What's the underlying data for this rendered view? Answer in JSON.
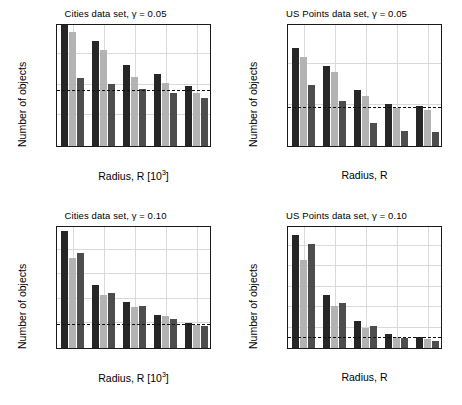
{
  "figure": {
    "kind": "matlab-figure",
    "panel_count": 4,
    "axis_label_y": "Number of objects",
    "series_colors": [
      "#262626",
      "#b3b3b3",
      "#4d4d4d"
    ],
    "threshold_color": "#111111",
    "grid_color": "#d9d9d9"
  },
  "chart_data": [
    {
      "type": "bar",
      "title": "Cities data set, γ = 0.05",
      "xlabel": "Radius, R [10³]",
      "ylabel": "Number of objects",
      "categories": [
        "20.0",
        "22.5",
        "25.0",
        "27.5",
        "30.0"
      ],
      "series": [
        {
          "name": "series-1",
          "color": "#262626",
          "values": [
            40.0,
            34.3,
            26.5,
            23.5,
            19.5
          ]
        },
        {
          "name": "series-2",
          "color": "#b3b3b3",
          "values": [
            37.0,
            31.3,
            22.3,
            20.5,
            17.4
          ]
        },
        {
          "name": "series-3",
          "color": "#4d4d4d",
          "values": [
            22.1,
            20.3,
            18.6,
            17.4,
            15.6
          ]
        }
      ],
      "threshold": 18.0,
      "threshold_style": "dashed",
      "ylim": [
        0,
        40
      ],
      "yticks": [
        0,
        10,
        20,
        30,
        40
      ],
      "grid": true,
      "legend": "none"
    },
    {
      "type": "bar",
      "title": "US Points data set, γ = 0.05",
      "xlabel": "Radius, R",
      "ylabel": "Number of objects",
      "categories": [
        "0.75",
        "1.00",
        "1.25",
        "1.50",
        "1.75"
      ],
      "series": [
        {
          "name": "series-1",
          "color": "#262626",
          "values": [
            120,
            98,
            68,
            51,
            49
          ]
        },
        {
          "name": "series-2",
          "color": "#b3b3b3",
          "values": [
            108,
            90,
            61,
            46,
            44
          ]
        },
        {
          "name": "series-3",
          "color": "#4d4d4d",
          "values": [
            75,
            55,
            28,
            18,
            17
          ]
        }
      ],
      "threshold": 46,
      "threshold_style": "dashed",
      "ylim": [
        0,
        150
      ],
      "yticks": [
        0,
        50,
        100,
        150
      ],
      "grid": true,
      "legend": "none"
    },
    {
      "type": "bar",
      "title": "Cities data set, γ = 0.10",
      "xlabel": "Radius, R [10³]",
      "ylabel": "Number of objects",
      "categories": [
        "20.0",
        "22.5",
        "25.0",
        "27.5",
        "30.0"
      ],
      "series": [
        {
          "name": "series-1",
          "color": "#262626",
          "values": [
            95,
            51.5,
            37.5,
            27,
            20.5
          ]
        },
        {
          "name": "series-2",
          "color": "#b3b3b3",
          "values": [
            73.5,
            43.5,
            33,
            26,
            19
          ]
        },
        {
          "name": "series-3",
          "color": "#4d4d4d",
          "values": [
            77.5,
            44.5,
            34,
            23.5,
            17.5
          ]
        }
      ],
      "threshold": 18.5,
      "threshold_style": "dashed",
      "ylim": [
        0,
        100
      ],
      "yticks": [
        0,
        20,
        40,
        60,
        80,
        100
      ],
      "grid": true,
      "legend": "none"
    },
    {
      "type": "bar",
      "title": "US Points data set, γ = 0.10",
      "xlabel": "Radius, R",
      "ylabel": "Number of objects",
      "categories": [
        "0.75",
        "1.00",
        "1.25",
        "1.50",
        "1.75"
      ],
      "series": [
        {
          "name": "series-1",
          "color": "#262626",
          "values": [
            550,
            260,
            133,
            68,
            53
          ]
        },
        {
          "name": "series-2",
          "color": "#b3b3b3",
          "values": [
            427,
            204,
            100,
            52,
            46
          ]
        },
        {
          "name": "series-3",
          "color": "#4d4d4d",
          "values": [
            507,
            222,
            105,
            50,
            36
          ]
        }
      ],
      "threshold": 48,
      "threshold_style": "dashed",
      "ylim": [
        0,
        600
      ],
      "yticks": [
        0,
        100,
        200,
        300,
        400,
        500,
        600
      ],
      "grid": true,
      "legend": "none"
    }
  ]
}
